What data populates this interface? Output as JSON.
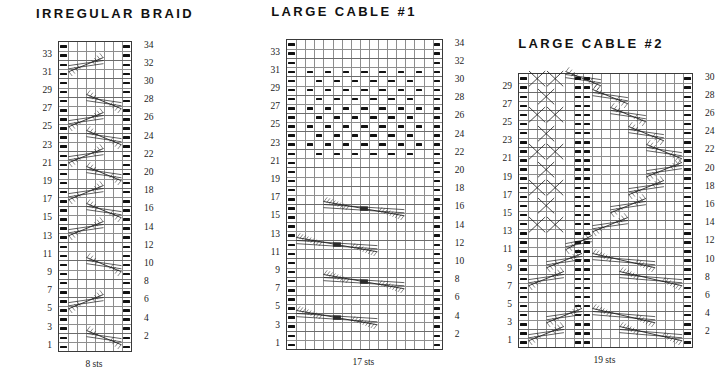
{
  "page": {
    "background": "#ffffff",
    "ink": "#111111",
    "gridline_color": "#8e8e8e",
    "border_color": "#3a3a3a"
  },
  "charts": [
    {
      "id": "irregular-braid",
      "title": "IRREGULAR BRAID",
      "stitch_count_label": "8 sts",
      "columns": 8,
      "rows": 34,
      "left_row_numbers": [
        "33",
        "31",
        "29",
        "27",
        "25",
        "23",
        "21",
        "19",
        "17",
        "15",
        "13",
        "11",
        "9",
        "7",
        "5",
        "3",
        "1"
      ],
      "right_row_numbers": [
        "34",
        "32",
        "30",
        "28",
        "26",
        "24",
        "22",
        "20",
        "18",
        "16",
        "14",
        "12",
        "10",
        "8",
        "6",
        "4",
        "2"
      ],
      "purl_columns": [
        1,
        8
      ],
      "cables": [
        {
          "row": 32,
          "start_col": 2,
          "span": 4,
          "dir": "right"
        },
        {
          "row": 28,
          "start_col": 4,
          "span": 4,
          "dir": "left"
        },
        {
          "row": 26,
          "start_col": 2,
          "span": 4,
          "dir": "right"
        },
        {
          "row": 24,
          "start_col": 4,
          "span": 4,
          "dir": "left"
        },
        {
          "row": 22,
          "start_col": 2,
          "span": 4,
          "dir": "right"
        },
        {
          "row": 20,
          "start_col": 4,
          "span": 4,
          "dir": "left"
        },
        {
          "row": 18,
          "start_col": 2,
          "span": 4,
          "dir": "right"
        },
        {
          "row": 16,
          "start_col": 4,
          "span": 4,
          "dir": "left"
        },
        {
          "row": 14,
          "start_col": 2,
          "span": 4,
          "dir": "right"
        },
        {
          "row": 10,
          "start_col": 4,
          "span": 4,
          "dir": "left"
        },
        {
          "row": 6,
          "start_col": 2,
          "span": 4,
          "dir": "right"
        },
        {
          "row": 2,
          "start_col": 4,
          "span": 4,
          "dir": "left"
        }
      ]
    },
    {
      "id": "large-cable-1",
      "title": "LARGE CABLE #1",
      "stitch_count_label": "17 sts",
      "columns": 17,
      "rows": 34,
      "left_row_numbers": [
        "33",
        "31",
        "29",
        "27",
        "25",
        "23",
        "21",
        "19",
        "17",
        "15",
        "13",
        "11",
        "9",
        "7",
        "5",
        "3",
        "1"
      ],
      "right_row_numbers": [
        "34",
        "32",
        "30",
        "28",
        "26",
        "24",
        "22",
        "20",
        "18",
        "16",
        "14",
        "12",
        "10",
        "8",
        "6",
        "4",
        "2"
      ],
      "purl_columns": [
        1,
        17
      ],
      "seed_block": {
        "from_row": 22,
        "to_row": 31,
        "from_col": 3,
        "to_col": 15
      },
      "cables": [
        {
          "row": 16,
          "start_col": 5,
          "span": 9,
          "dir": "left",
          "type": "big"
        },
        {
          "row": 12,
          "start_col": 2,
          "span": 9,
          "dir": "right",
          "type": "big"
        },
        {
          "row": 8,
          "start_col": 5,
          "span": 9,
          "dir": "left",
          "type": "big"
        },
        {
          "row": 4,
          "start_col": 2,
          "span": 9,
          "dir": "right",
          "type": "big"
        }
      ]
    },
    {
      "id": "large-cable-2",
      "title": "LARGE CABLE #2",
      "stitch_count_label": "19 sts",
      "columns": 19,
      "rows": 30,
      "left_row_numbers": [
        "29",
        "27",
        "25",
        "23",
        "21",
        "19",
        "17",
        "15",
        "13",
        "11",
        "9",
        "7",
        "5",
        "3",
        "1"
      ],
      "right_row_numbers": [
        "30",
        "28",
        "26",
        "24",
        "22",
        "20",
        "18",
        "16",
        "14",
        "12",
        "10",
        "8",
        "6",
        "4",
        "2"
      ],
      "purl_columns": [
        1,
        19
      ],
      "purl_pair_columns": [
        7,
        8
      ],
      "cables": [
        {
          "row": 30,
          "start_col": 2,
          "span": 2,
          "dir": "cross"
        },
        {
          "row": 30,
          "start_col": 4,
          "span": 2,
          "dir": "cross"
        },
        {
          "row": 30,
          "start_col": 6,
          "span": 4,
          "dir": "left-long"
        },
        {
          "row": 28,
          "start_col": 3,
          "span": 2,
          "dir": "cross"
        },
        {
          "row": 28,
          "start_col": 9,
          "span": 4,
          "dir": "left-long"
        },
        {
          "row": 26,
          "start_col": 2,
          "span": 2,
          "dir": "cross"
        },
        {
          "row": 26,
          "start_col": 4,
          "span": 2,
          "dir": "cross"
        },
        {
          "row": 26,
          "start_col": 11,
          "span": 4,
          "dir": "left-long"
        },
        {
          "row": 24,
          "start_col": 3,
          "span": 2,
          "dir": "cross"
        },
        {
          "row": 24,
          "start_col": 13,
          "span": 4,
          "dir": "left-long"
        },
        {
          "row": 22,
          "start_col": 2,
          "span": 2,
          "dir": "cross"
        },
        {
          "row": 22,
          "start_col": 4,
          "span": 2,
          "dir": "cross"
        },
        {
          "row": 22,
          "start_col": 15,
          "span": 4,
          "dir": "left-long"
        },
        {
          "row": 20,
          "start_col": 3,
          "span": 2,
          "dir": "cross"
        },
        {
          "row": 20,
          "start_col": 15,
          "span": 4,
          "dir": "right-long"
        },
        {
          "row": 18,
          "start_col": 2,
          "span": 2,
          "dir": "cross"
        },
        {
          "row": 18,
          "start_col": 4,
          "span": 2,
          "dir": "cross"
        },
        {
          "row": 18,
          "start_col": 13,
          "span": 4,
          "dir": "right-long"
        },
        {
          "row": 16,
          "start_col": 3,
          "span": 2,
          "dir": "cross"
        },
        {
          "row": 16,
          "start_col": 11,
          "span": 4,
          "dir": "right-long"
        },
        {
          "row": 14,
          "start_col": 2,
          "span": 2,
          "dir": "cross"
        },
        {
          "row": 14,
          "start_col": 4,
          "span": 2,
          "dir": "cross"
        },
        {
          "row": 14,
          "start_col": 9,
          "span": 4,
          "dir": "right-long"
        },
        {
          "row": 12,
          "start_col": 6,
          "span": 3,
          "dir": "right-long"
        },
        {
          "row": 10,
          "start_col": 4,
          "span": 4,
          "dir": "right-long"
        },
        {
          "row": 10,
          "start_col": 9,
          "span": 7,
          "dir": "left-long"
        },
        {
          "row": 8,
          "start_col": 2,
          "span": 4,
          "dir": "right-long"
        },
        {
          "row": 8,
          "start_col": 12,
          "span": 7,
          "dir": "left-long"
        },
        {
          "row": 4,
          "start_col": 4,
          "span": 4,
          "dir": "right-long"
        },
        {
          "row": 4,
          "start_col": 9,
          "span": 7,
          "dir": "left-long"
        },
        {
          "row": 2,
          "start_col": 2,
          "span": 4,
          "dir": "right-long"
        },
        {
          "row": 2,
          "start_col": 12,
          "span": 7,
          "dir": "left-long"
        }
      ]
    }
  ]
}
